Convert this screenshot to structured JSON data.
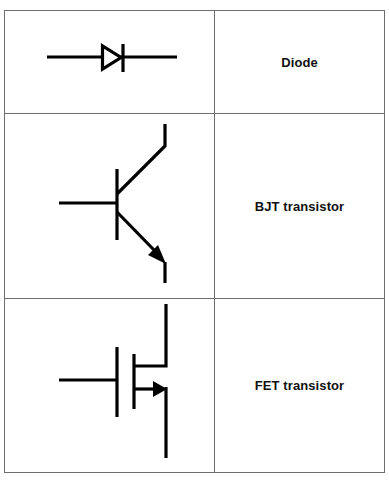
{
  "heading": {
    "text": "Circuit symbols (partially cut off)"
  },
  "table": {
    "rows": [
      {
        "symbol": "diode-symbol",
        "label": "Diode"
      },
      {
        "symbol": "bjt-transistor-symbol",
        "label": "BJT transistor"
      },
      {
        "symbol": "fet-transistor-symbol",
        "label": "FET transistor"
      }
    ]
  },
  "colors": {
    "stroke": "#000000",
    "border": "#6e6e6e",
    "background": "#ffffff"
  }
}
